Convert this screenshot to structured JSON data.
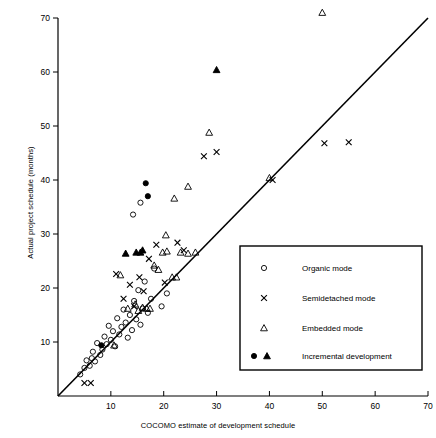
{
  "chart_data": {
    "type": "scatter",
    "title": "",
    "xlabel": "COCOMO estimate of development schedule",
    "ylabel": "Actual project schedule (months)",
    "xlim": [
      0,
      70
    ],
    "ylim": [
      0,
      70
    ],
    "xticks": [
      10,
      20,
      30,
      40,
      50,
      60,
      70
    ],
    "yticks": [
      10,
      20,
      30,
      40,
      50,
      60,
      70
    ],
    "grid": false,
    "reference_line": {
      "label": "y = x",
      "from": [
        0,
        0
      ],
      "to": [
        70,
        70
      ]
    },
    "legend": {
      "position": "lower-right",
      "entries": [
        {
          "label": "Organic mode",
          "marker": "open-circle"
        },
        {
          "label": "Semidetached mode",
          "marker": "cross"
        },
        {
          "label": "Embedded mode",
          "marker": "open-triangle"
        },
        {
          "label": "Incremental development",
          "marker": "filled-circle-and-filled-triangle"
        }
      ]
    },
    "series": [
      {
        "name": "Organic mode",
        "marker": "open-circle",
        "points": [
          [
            4.2,
            4.0
          ],
          [
            5.0,
            5.2
          ],
          [
            5.4,
            6.6
          ],
          [
            6.0,
            5.6
          ],
          [
            6.4,
            7.0
          ],
          [
            6.6,
            8.2
          ],
          [
            7.0,
            6.4
          ],
          [
            7.4,
            9.8
          ],
          [
            8.0,
            7.6
          ],
          [
            8.4,
            8.6
          ],
          [
            8.8,
            11.0
          ],
          [
            9.2,
            9.6
          ],
          [
            9.6,
            13.0
          ],
          [
            10.0,
            10.4
          ],
          [
            10.4,
            12.0
          ],
          [
            10.8,
            9.2
          ],
          [
            11.2,
            14.4
          ],
          [
            11.6,
            11.4
          ],
          [
            12.0,
            12.8
          ],
          [
            12.4,
            16.0
          ],
          [
            12.8,
            13.6
          ],
          [
            13.2,
            10.8
          ],
          [
            13.6,
            15.0
          ],
          [
            14.0,
            12.2
          ],
          [
            14.4,
            17.6
          ],
          [
            14.8,
            14.2
          ],
          [
            15.2,
            19.6
          ],
          [
            15.6,
            13.2
          ],
          [
            16.0,
            16.2
          ],
          [
            16.4,
            21.2
          ],
          [
            17.0,
            15.4
          ],
          [
            17.6,
            18.0
          ],
          [
            14.2,
            33.6
          ],
          [
            15.6,
            35.8
          ],
          [
            18.2,
            23.6
          ],
          [
            19.6,
            16.6
          ],
          [
            20.6,
            19.0
          ]
        ]
      },
      {
        "name": "Semidetached mode",
        "marker": "cross",
        "points": [
          [
            5.0,
            2.4
          ],
          [
            6.2,
            2.4
          ],
          [
            11.0,
            22.6
          ],
          [
            12.4,
            18.0
          ],
          [
            13.6,
            20.6
          ],
          [
            14.4,
            16.6
          ],
          [
            15.4,
            22.0
          ],
          [
            16.2,
            19.4
          ],
          [
            17.2,
            25.4
          ],
          [
            18.6,
            28.0
          ],
          [
            20.2,
            21.0
          ],
          [
            22.6,
            28.4
          ],
          [
            23.8,
            27.0
          ],
          [
            27.6,
            44.4
          ],
          [
            30.0,
            45.2
          ],
          [
            40.6,
            40.0
          ],
          [
            50.4,
            46.8
          ],
          [
            55.0,
            47.0
          ]
        ]
      },
      {
        "name": "Embedded mode",
        "marker": "open-triangle",
        "points": [
          [
            10.6,
            9.4
          ],
          [
            11.8,
            22.4
          ],
          [
            13.2,
            16.2
          ],
          [
            14.6,
            17.0
          ],
          [
            15.2,
            15.8
          ],
          [
            16.0,
            16.4
          ],
          [
            16.8,
            16.2
          ],
          [
            17.4,
            16.2
          ],
          [
            18.2,
            24.2
          ],
          [
            19.0,
            23.4
          ],
          [
            19.8,
            26.6
          ],
          [
            20.6,
            26.8
          ],
          [
            21.6,
            22.0
          ],
          [
            22.4,
            22.0
          ],
          [
            23.2,
            26.6
          ],
          [
            24.6,
            26.4
          ],
          [
            26.0,
            26.6
          ],
          [
            20.4,
            29.8
          ],
          [
            22.0,
            36.6
          ],
          [
            24.6,
            38.8
          ],
          [
            28.6,
            48.8
          ],
          [
            40.0,
            40.4
          ],
          [
            50.0,
            71.0
          ]
        ]
      },
      {
        "name": "Incremental development",
        "marker": "filled",
        "points": [
          [
            8.2,
            9.4
          ],
          [
            12.8,
            26.4
          ],
          [
            14.8,
            26.6
          ],
          [
            15.6,
            26.6
          ],
          [
            16.0,
            27.0
          ],
          [
            17.0,
            37.0
          ],
          [
            16.6,
            39.4
          ],
          [
            30.0,
            60.4
          ]
        ]
      }
    ]
  },
  "legend_box": {
    "x": 240,
    "y": 246,
    "w": 182,
    "h": 124
  },
  "colors": {
    "axis": "#000000",
    "marker": "#000000",
    "background": "#ffffff"
  }
}
